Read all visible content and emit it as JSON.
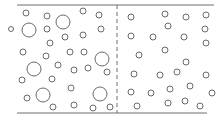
{
  "diagram": {
    "colors": {
      "line": "#6e6e6e",
      "particle": "#6a6a6a",
      "background": "#ffffff"
    },
    "top_wall": {
      "x1": 17,
      "y1": 5,
      "x2": 214,
      "y2": 5
    },
    "bottom_wall": {
      "x1": 17,
      "y1": 113,
      "x2": 207,
      "y2": 113
    },
    "partition": {
      "x": 117,
      "y1": 5,
      "y2": 113,
      "style": "dashed"
    },
    "left_particles": [
      {
        "x": 26,
        "y": 13,
        "r": 3
      },
      {
        "x": 47,
        "y": 16,
        "r": 3
      },
      {
        "x": 63,
        "y": 22,
        "r": 7
      },
      {
        "x": 83,
        "y": 11,
        "r": 3
      },
      {
        "x": 99,
        "y": 15,
        "r": 3
      },
      {
        "x": 11,
        "y": 29,
        "r": 2.5
      },
      {
        "x": 29,
        "y": 30,
        "r": 7
      },
      {
        "x": 47,
        "y": 29,
        "r": 3
      },
      {
        "x": 101,
        "y": 29,
        "r": 3
      },
      {
        "x": 65,
        "y": 37,
        "r": 3
      },
      {
        "x": 83,
        "y": 35,
        "r": 3
      },
      {
        "x": 50,
        "y": 43,
        "r": 3
      },
      {
        "x": 23,
        "y": 52,
        "r": 3
      },
      {
        "x": 46,
        "y": 56,
        "r": 3
      },
      {
        "x": 70,
        "y": 52,
        "r": 3
      },
      {
        "x": 84,
        "y": 52,
        "r": 3
      },
      {
        "x": 102,
        "y": 59,
        "r": 7
      },
      {
        "x": 34,
        "y": 69,
        "r": 7
      },
      {
        "x": 58,
        "y": 65,
        "r": 3
      },
      {
        "x": 74,
        "y": 70,
        "r": 3
      },
      {
        "x": 88,
        "y": 68,
        "r": 3
      },
      {
        "x": 107,
        "y": 72,
        "r": 3
      },
      {
        "x": 22,
        "y": 80,
        "r": 3
      },
      {
        "x": 52,
        "y": 79,
        "r": 3
      },
      {
        "x": 71,
        "y": 88,
        "r": 3
      },
      {
        "x": 27,
        "y": 98,
        "r": 3
      },
      {
        "x": 43,
        "y": 95,
        "r": 7
      },
      {
        "x": 74,
        "y": 105,
        "r": 3
      },
      {
        "x": 100,
        "y": 94,
        "r": 7
      },
      {
        "x": 53,
        "y": 107,
        "r": 3
      },
      {
        "x": 93,
        "y": 108,
        "r": 3
      },
      {
        "x": 110,
        "y": 107,
        "r": 3
      }
    ],
    "right_particles": [
      {
        "x": 131,
        "y": 17,
        "r": 3
      },
      {
        "x": 165,
        "y": 14,
        "r": 3
      },
      {
        "x": 186,
        "y": 17,
        "r": 3
      },
      {
        "x": 206,
        "y": 15,
        "r": 3
      },
      {
        "x": 168,
        "y": 26,
        "r": 3
      },
      {
        "x": 205,
        "y": 29,
        "r": 3
      },
      {
        "x": 131,
        "y": 36,
        "r": 3
      },
      {
        "x": 153,
        "y": 37,
        "r": 3
      },
      {
        "x": 184,
        "y": 37,
        "r": 3
      },
      {
        "x": 206,
        "y": 43,
        "r": 3
      },
      {
        "x": 139,
        "y": 55,
        "r": 3
      },
      {
        "x": 165,
        "y": 50,
        "r": 3
      },
      {
        "x": 186,
        "y": 62,
        "r": 3
      },
      {
        "x": 134,
        "y": 74,
        "r": 3
      },
      {
        "x": 160,
        "y": 75,
        "r": 3
      },
      {
        "x": 177,
        "y": 72,
        "r": 3
      },
      {
        "x": 206,
        "y": 75,
        "r": 3
      },
      {
        "x": 131,
        "y": 92,
        "r": 3
      },
      {
        "x": 151,
        "y": 93,
        "r": 3
      },
      {
        "x": 170,
        "y": 89,
        "r": 3
      },
      {
        "x": 190,
        "y": 86,
        "r": 3
      },
      {
        "x": 212,
        "y": 93,
        "r": 3
      },
      {
        "x": 137,
        "y": 106,
        "r": 3
      },
      {
        "x": 168,
        "y": 103,
        "r": 3
      },
      {
        "x": 185,
        "y": 101,
        "r": 3
      },
      {
        "x": 200,
        "y": 106,
        "r": 3
      }
    ]
  }
}
